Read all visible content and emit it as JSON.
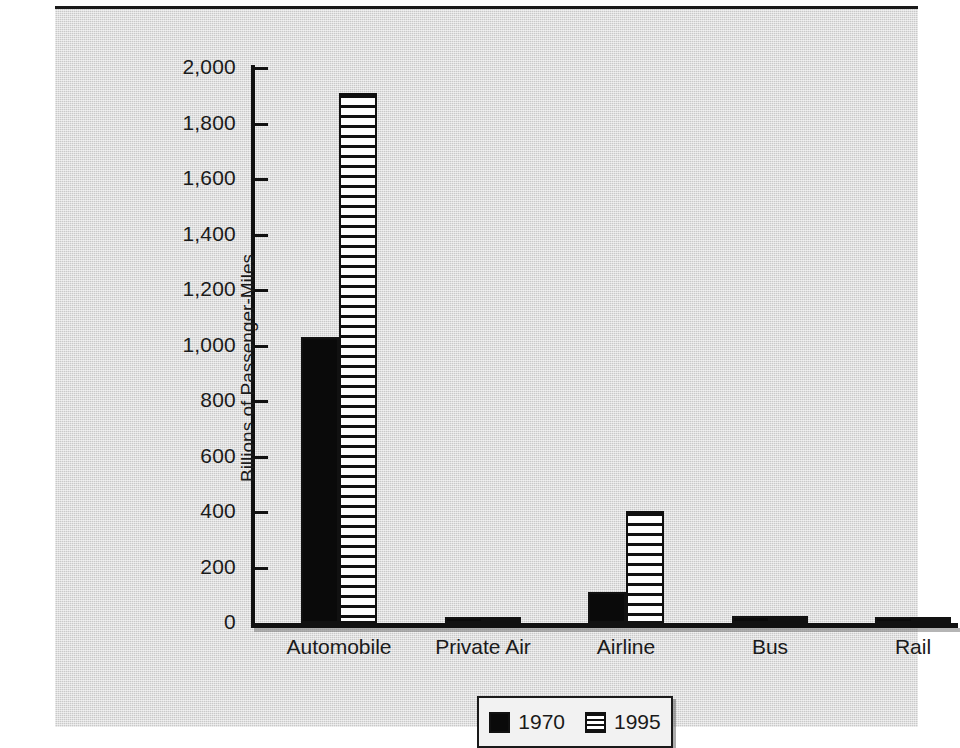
{
  "chart_data": {
    "type": "bar",
    "title": "",
    "subtitle": "",
    "xlabel": "",
    "ylabel": "Billions of Passenger-Miles",
    "ylim": [
      0,
      2000
    ],
    "ytick_labels": [
      "2,000",
      "1,800",
      "1,600",
      "1,400",
      "1,200",
      "1,000",
      "800",
      "600",
      "400",
      "200",
      "0"
    ],
    "ytick_values": [
      2000,
      1800,
      1600,
      1400,
      1200,
      1000,
      800,
      600,
      400,
      200,
      0
    ],
    "grid": false,
    "legend_position": "bottom-center",
    "categories": [
      "Automobile",
      "Private Air",
      "Airline",
      "Bus",
      "Rail"
    ],
    "series": [
      {
        "name": "1970",
        "color": "#0a0a0a",
        "fill": "solid",
        "values": [
          1030,
          9,
          110,
          25,
          11
        ]
      },
      {
        "name": "1995",
        "color": "#ffffff",
        "fill": "horizontal-stripes",
        "values": [
          1910,
          12,
          403,
          26,
          13
        ]
      }
    ]
  },
  "legend": {
    "entries": [
      {
        "label": "1970",
        "swatch": "solid-black-swatch-icon"
      },
      {
        "label": "1995",
        "swatch": "striped-swatch-icon"
      }
    ]
  },
  "colors": {
    "panel_background": "#c9c9c9",
    "axis": "#111111",
    "text": "#1a1a1a",
    "series_1970": "#0a0a0a",
    "series_1995": "#ffffff"
  }
}
